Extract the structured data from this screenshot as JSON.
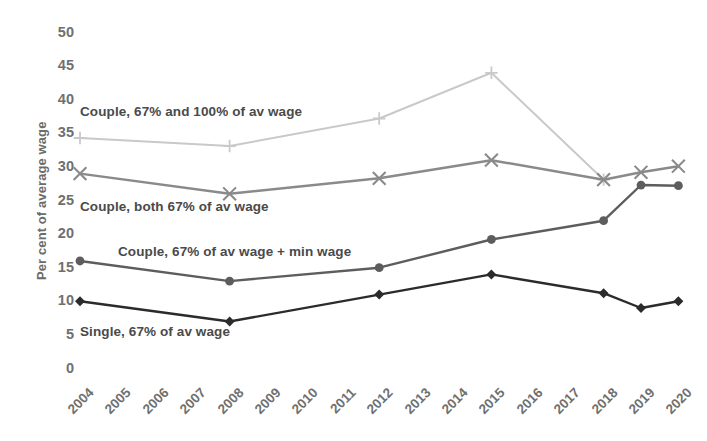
{
  "chart_data": {
    "type": "line",
    "title": "",
    "xlabel": "",
    "ylabel": "Per cent of average wage",
    "ylim": [
      0,
      50
    ],
    "ytick_step": 5,
    "yticks": [
      "0",
      "5",
      "10",
      "15",
      "20",
      "25",
      "30",
      "35",
      "40",
      "45",
      "50"
    ],
    "grid": false,
    "legend_position": "inline-annotations",
    "categories": [
      "2004",
      "2005",
      "2006",
      "2007",
      "2008",
      "2009",
      "2010",
      "2011",
      "2012",
      "2013",
      "2014",
      "2015",
      "2016",
      "2017",
      "2018",
      "2019",
      "2020"
    ],
    "x": [
      2004,
      2008,
      2012,
      2015,
      2018,
      2019,
      2020
    ],
    "series": [
      {
        "name": "Couple, 67% and 100% of av wage",
        "marker": "plus",
        "color": "#c9c9c9",
        "x": [
          2004,
          2008,
          2012,
          2015,
          2018
        ],
        "values": [
          34.3,
          33.1,
          37.2,
          44.0,
          28.1
        ]
      },
      {
        "name": "Couple, both 67% of av wage",
        "marker": "cross",
        "color": "#8a8a8a",
        "x": [
          2004,
          2008,
          2012,
          2015,
          2018,
          2019,
          2020
        ],
        "values": [
          29.0,
          26.0,
          28.3,
          31.0,
          28.1,
          29.2,
          30.1
        ]
      },
      {
        "name": "Couple, 67% of av wage + min wage",
        "marker": "circle",
        "color": "#5d5d5d",
        "x": [
          2004,
          2008,
          2012,
          2015,
          2018,
          2019,
          2020
        ],
        "values": [
          16.0,
          13.0,
          15.0,
          19.2,
          22.0,
          27.3,
          27.2
        ]
      },
      {
        "name": "Single, 67% of av wage",
        "marker": "diamond",
        "color": "#2b2b2b",
        "x": [
          2004,
          2008,
          2012,
          2015,
          2018,
          2019,
          2020
        ],
        "values": [
          10.0,
          7.0,
          11.0,
          14.0,
          11.2,
          9.0,
          10.0
        ]
      }
    ],
    "annotations": [
      {
        "text": "Couple, 67% and 100% of av wage",
        "x_px": 80,
        "y_px": 104
      },
      {
        "text": "Couple, both 67% of av wage",
        "x_px": 80,
        "y_px": 199
      },
      {
        "text": "Couple, 67% of av wage + min wage",
        "x_px": 118,
        "y_px": 244
      },
      {
        "text": "Single, 67% of av wage",
        "x_px": 80,
        "y_px": 324
      }
    ]
  },
  "axis": {
    "y_title": "Per cent of average wage"
  }
}
